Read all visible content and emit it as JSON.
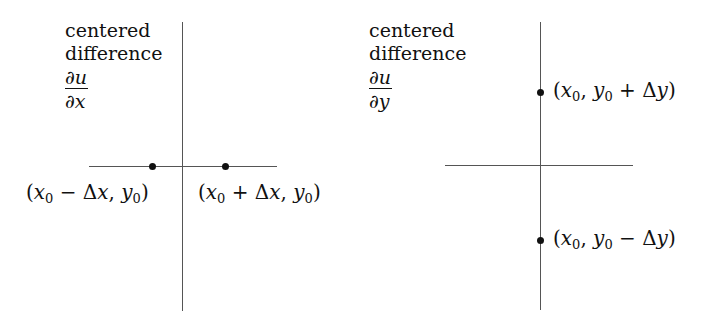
{
  "panels": [
    {
      "id": "x",
      "caption": {
        "line1": "centered",
        "line2": "difference",
        "numerator": "∂u",
        "denominator": "∂x"
      },
      "points": [
        {
          "label_parts": [
            "(",
            "x",
            "0",
            " − Δ",
            "x",
            ", ",
            "y",
            "0",
            ")"
          ],
          "label": "(x0 − Δx, y0)"
        },
        {
          "label_parts": [
            "(",
            "x",
            "0",
            " + Δ",
            "x",
            ", ",
            "y",
            "0",
            ")"
          ],
          "label": "(x0 + Δx, y0)"
        }
      ]
    },
    {
      "id": "y",
      "caption": {
        "line1": "centered",
        "line2": "difference",
        "numerator": "∂u",
        "denominator": "∂y"
      },
      "points": [
        {
          "label_parts": [
            "(",
            "x",
            "0",
            ", ",
            "y",
            "0",
            " + Δ",
            "y",
            ")"
          ],
          "label": "(x0, y0 + Δy)"
        },
        {
          "label_parts": [
            "(",
            "x",
            "0",
            ", ",
            "y",
            "0",
            " − Δ",
            "y",
            ")"
          ],
          "label": "(x0, y0 − Δy)"
        }
      ]
    }
  ],
  "colors": {
    "axis": "#555555",
    "dot": "#111111",
    "text": "#111111",
    "background": "#ffffff"
  }
}
